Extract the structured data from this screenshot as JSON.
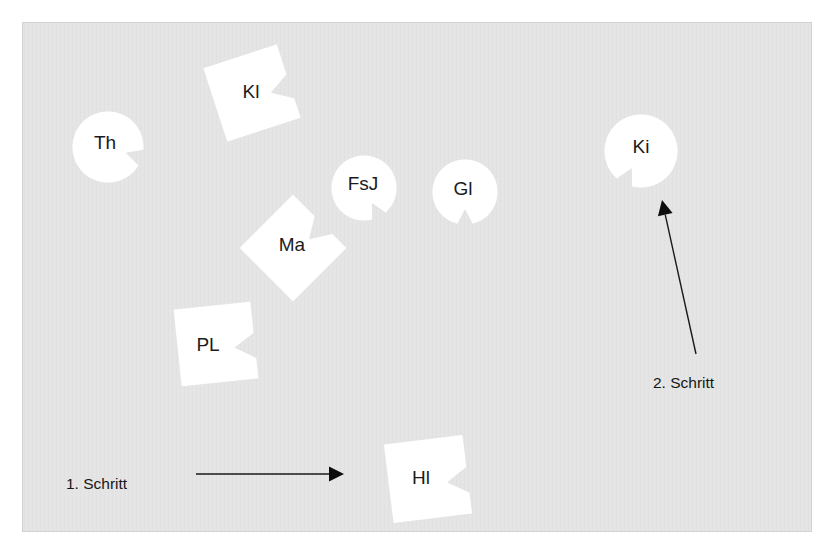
{
  "page": {
    "width": 834,
    "height": 556,
    "background_color": "#ffffff"
  },
  "panel": {
    "name": "diagram-panel",
    "x": 22,
    "y": 22,
    "width": 790,
    "height": 510,
    "fill_color": "#e3e3e3",
    "border_color": "#d2d2d2"
  },
  "style": {
    "shape_fill_color": "#ffffff",
    "shape_edge_color": "#e2e2e2",
    "label_text_color": "#1b1b1b",
    "arrow_color": "#0d0d0d"
  },
  "shapes": [
    {
      "id": "th",
      "label": "Th",
      "kind": "circle-with-notch",
      "cx": 108,
      "cy": 147,
      "r": 36,
      "notch_angle_deg": 18,
      "label_x": 105,
      "label_y": 144
    },
    {
      "id": "kl",
      "label": "Kl",
      "kind": "square-with-notch",
      "cx": 252,
      "cy": 93,
      "size": 78,
      "rotation_deg": -18,
      "label_x": 251,
      "label_y": 93
    },
    {
      "id": "fsj",
      "label": "FsJ",
      "kind": "circle-with-notch",
      "cx": 364,
      "cy": 188,
      "r": 33,
      "notch_angle_deg": 62,
      "label_x": 363,
      "label_y": 185
    },
    {
      "id": "gl",
      "label": "Gl",
      "kind": "circle-with-notch",
      "cx": 465,
      "cy": 192,
      "r": 33,
      "notch_angle_deg": 90,
      "label_x": 463,
      "label_y": 190
    },
    {
      "id": "ki",
      "label": "Ki",
      "kind": "circle-with-notch",
      "cx": 641,
      "cy": 151,
      "r": 37,
      "notch_angle_deg": 118,
      "label_x": 641,
      "label_y": 148
    },
    {
      "id": "ma",
      "label": "Ma",
      "kind": "square-with-notch",
      "cx": 293,
      "cy": 248,
      "size": 76,
      "rotation_deg": -45,
      "label_x": 292,
      "label_y": 246
    },
    {
      "id": "pl",
      "label": "PL",
      "kind": "square-with-notch",
      "cx": 216,
      "cy": 344,
      "size": 78,
      "rotation_deg": -6,
      "label_x": 208,
      "label_y": 346
    },
    {
      "id": "hl",
      "label": "Hl",
      "kind": "square-with-notch",
      "cx": 428,
      "cy": 479,
      "size": 80,
      "rotation_deg": -7,
      "label_x": 421,
      "label_y": 479
    }
  ],
  "arrows": [
    {
      "id": "arrow-step-1",
      "label": "1. Schritt",
      "label_x": 66,
      "label_y": 489,
      "x1": 196,
      "y1": 474,
      "x2": 344,
      "y2": 474,
      "direction": "right"
    },
    {
      "id": "arrow-step-2",
      "label": "2. Schritt",
      "label_x": 653,
      "label_y": 388,
      "x1": 696,
      "y1": 354,
      "x2": 662,
      "y2": 200,
      "direction": "up-left"
    }
  ]
}
